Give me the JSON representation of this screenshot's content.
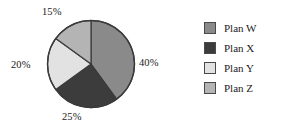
{
  "chart_data": {
    "type": "pie",
    "title": "",
    "subtitle": "",
    "xlabel": "",
    "ylabel": "",
    "grid": false,
    "legend_position": "right",
    "start_angle_deg": 90,
    "direction": "clockwise",
    "categories": [
      "Plan W",
      "Plan X",
      "Plan Y",
      "Plan Z"
    ],
    "values": [
      40,
      25,
      20,
      15
    ],
    "value_unit": "%",
    "data_labels": [
      "40%",
      "25%",
      "20%",
      "15%"
    ],
    "colors": [
      "#8a8a8a",
      "#3c3c3c",
      "#e2e2e2",
      "#b4b4b4"
    ],
    "slices": [
      {
        "name": "Plan W",
        "value": 40,
        "label": "40%",
        "color": "#8a8a8a"
      },
      {
        "name": "Plan X",
        "value": 25,
        "label": "25%",
        "color": "#3c3c3c"
      },
      {
        "name": "Plan Y",
        "value": 20,
        "label": "20%",
        "color": "#e2e2e2"
      },
      {
        "name": "Plan Z",
        "value": 15,
        "label": "15%",
        "color": "#b4b4b4"
      }
    ]
  },
  "legend": {
    "items": [
      {
        "label": "Plan W",
        "color": "#8a8a8a"
      },
      {
        "label": "Plan X",
        "color": "#3c3c3c"
      },
      {
        "label": "Plan Y",
        "color": "#e2e2e2"
      },
      {
        "label": "Plan Z",
        "color": "#b4b4b4"
      }
    ]
  },
  "style": {
    "background": "#ffffff",
    "outline": "#3a3a3a",
    "text": "#1a1a1a"
  }
}
